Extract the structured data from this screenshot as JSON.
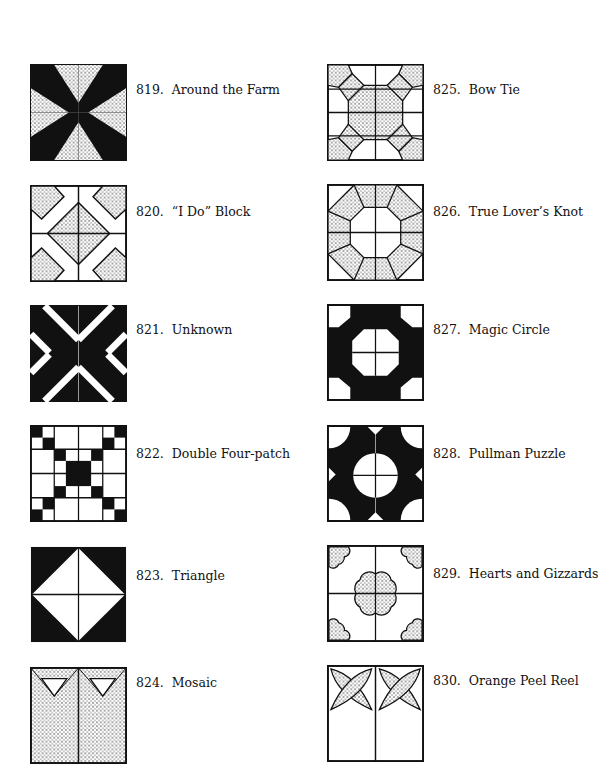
{
  "page": {
    "left_column": [
      {
        "number": "819.",
        "name": "Around the Farm"
      },
      {
        "number": "820.",
        "name": "“I Do” Block"
      },
      {
        "number": "821.",
        "name": "Unknown"
      },
      {
        "number": "822.",
        "name": "Double Four-patch"
      },
      {
        "number": "823.",
        "name": "Triangle"
      },
      {
        "number": "824.",
        "name": "Mosaic"
      }
    ],
    "right_column": [
      {
        "number": "825.",
        "name": "Bow Tie"
      },
      {
        "number": "826.",
        "name": "True Lover’s Knot"
      },
      {
        "number": "827.",
        "name": "Magic Circle"
      },
      {
        "number": "828.",
        "name": "Pullman Puzzle"
      },
      {
        "number": "829.",
        "name": "Hearts and Gizzards"
      },
      {
        "number": "830.",
        "name": "Orange Peel Reel"
      }
    ]
  }
}
